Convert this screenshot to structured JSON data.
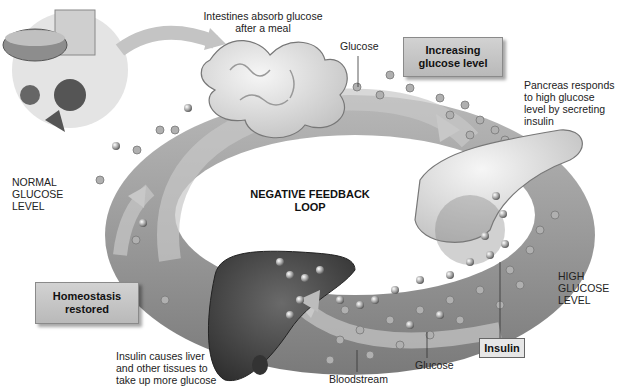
{
  "diagram": {
    "title_line1": "NEGATIVE FEEDBACK",
    "title_line2": "LOOP",
    "labels": {
      "intestines_line1": "Intestines absorb glucose",
      "intestines_line2": "after a meal",
      "glucose_top": "Glucose",
      "pancreas_line1": "Pancreas responds",
      "pancreas_line2": "to high glucose",
      "pancreas_line3": "level by secreting",
      "pancreas_line4": "insulin",
      "normal_line1": "NORMAL",
      "normal_line2": "GLUCOSE",
      "normal_line3": "LEVEL",
      "high_line1": "HIGH",
      "high_line2": "GLUCOSE",
      "high_line3": "LEVEL",
      "liver_line1": "Insulin causes liver",
      "liver_line2": "and other tissues to",
      "liver_line3": "take up more glucose",
      "bloodstream": "Bloodstream",
      "glucose_bottom": "Glucose"
    },
    "boxes": {
      "increasing_line1": "Increasing",
      "increasing_line2": "glucose level",
      "homeostasis_line1": "Homeostasis",
      "homeostasis_line2": "restored",
      "insulin": "Insulin"
    },
    "colors": {
      "bloodstream": "#9a9a9a",
      "organ_light": "#e8e8e8",
      "liver": "#4a4a4a",
      "box": "#c4c4c4"
    }
  }
}
